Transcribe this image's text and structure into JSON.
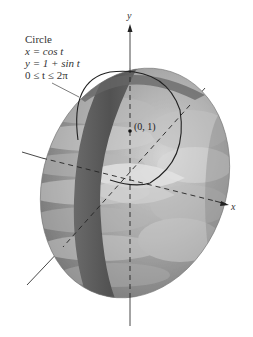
{
  "figure": {
    "title": "Circle",
    "equations": [
      "x = cos t",
      "y = 1 + sin t",
      "0 ≤ t ≤ 2π"
    ],
    "axis_labels": {
      "x": "x",
      "y": "y"
    },
    "point_label": "(0, 1)"
  },
  "colors": {
    "surface_light": "#c8c8c8",
    "surface_mid": "#9a9a9a",
    "surface_dark": "#6e6e6e",
    "band": "#5c5c5c",
    "axis": "#333333",
    "text": "#333333"
  }
}
